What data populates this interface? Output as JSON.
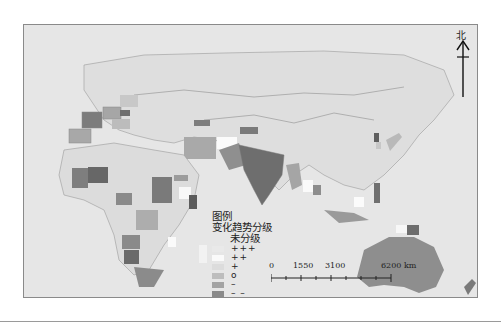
{
  "map": {
    "background_color": "#e6e6e6",
    "border_color": "#cfcfcf"
  },
  "north_arrow": {
    "label": "北",
    "icon": "north-arrow-icon"
  },
  "legend": {
    "title": "图例",
    "subtitle": "变化趋势分级",
    "items": [
      {
        "label": "未分级",
        "color": null
      },
      {
        "label": "+++",
        "color": "#e9e9e9"
      },
      {
        "label": "++",
        "color": "#fafafa"
      },
      {
        "label": "+",
        "color": "#dcdcdc"
      },
      {
        "label": "o",
        "color": "#bdbdbd"
      },
      {
        "label": "–",
        "color": "#a3a3a3"
      },
      {
        "label": "– –",
        "color": "#8a8a8a"
      },
      {
        "label": "– – –",
        "color": "#6b6b6b"
      }
    ]
  },
  "scale_bar": {
    "ticks": [
      "0",
      "1550",
      "3100",
      "6200 km"
    ],
    "unit": "km"
  }
}
